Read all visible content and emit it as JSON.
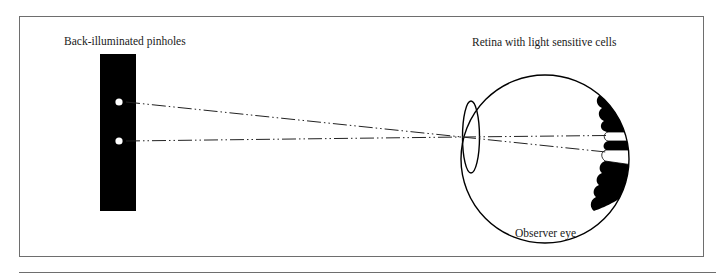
{
  "diagram": {
    "labels": {
      "pinholes": "Back-illuminated pinholes",
      "retina": "Retina with light sensitive cells",
      "eye": "Observer eye"
    },
    "elements": {
      "pinhole_plate": {
        "color": "#000000",
        "pinhole_count": 2
      },
      "rays": {
        "count": 2,
        "style": "dash-dot-dot",
        "converge_at": "lens"
      },
      "eye": {
        "parts": [
          "eyeball",
          "lens",
          "retina"
        ]
      },
      "retina_cells": {
        "stimulated_cells": 2,
        "cell_color": "#000000",
        "stimulated_color": "#ffffff"
      }
    },
    "colors": {
      "frame": "#6e6e6e",
      "ink": "#000000",
      "background": "#ffffff"
    }
  }
}
